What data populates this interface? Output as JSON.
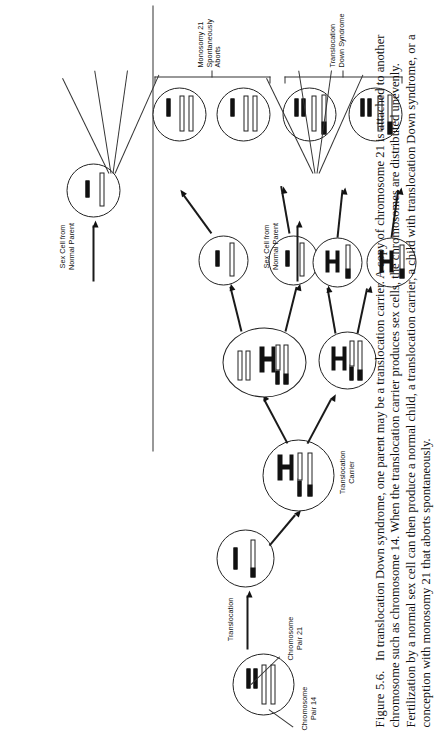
{
  "figure": {
    "number": "Figure 5.6.",
    "caption": "In translocation Down syndrome, one parent may be a translocation carrier. A copy of chromosome 21 is attached to another chromosome such as chromosome 14. When the translocation carrier produces sex cells, the chromosomes are distributed unevenly. Fertilization by a normal sex cell can then produce a normal child, a translocation carrier, a child with translocation Down syndrome, or a conception with monosomy 21 that aborts spontaneously.",
    "title_alt": "Translocation Down syndrome inheritance"
  },
  "labels": {
    "chromosome_pair_14": "Chromosome\nPair 14",
    "chromosome_pair_21": "Chromosome\nPair 21",
    "translocation": "Translocation",
    "translocation_carrier": "Translocation\nCarrier",
    "sex_cell_normal_left": "Sex Cell from\nNormal Parent",
    "sex_cell_normal_right": "Sex Cell from\nNormal Parent",
    "outcome_translocation_carriers": "Translocation\nCarriers",
    "outcome_normal": "Normal",
    "outcome_translocation_down": "Translocation\nDown Syndrome",
    "outcome_monosomy": "Monosomy 21\nSpontaneously Aborts"
  },
  "colors": {
    "ink": "#111111",
    "line": "#333333",
    "paper": "#ffffff"
  },
  "diagram": {
    "cells": [
      {
        "id": "normal-parent-cell",
        "role": "Normal parent cell with chromosome pair 14 and pair 21"
      },
      {
        "id": "translocation-event-cell",
        "role": "Cell undergoing translocation"
      },
      {
        "id": "translocation-carrier-cell",
        "role": "Translocation carrier parent cell"
      },
      {
        "id": "meiosis-upper-cell",
        "role": "Meiotic intermediate cell, upper branch"
      },
      {
        "id": "meiosis-lower-cell",
        "role": "Meiotic intermediate cell, lower branch"
      },
      {
        "id": "gamete-1",
        "role": "Sex cell of translocation carrier"
      },
      {
        "id": "gamete-2",
        "role": "Sex cell of translocation carrier"
      },
      {
        "id": "gamete-3",
        "role": "Sex cell of translocation carrier"
      },
      {
        "id": "gamete-4",
        "role": "Sex cell of translocation carrier"
      },
      {
        "id": "normal-gamete-left",
        "role": "Sex cell from normal parent, left branch"
      },
      {
        "id": "normal-gamete-right",
        "role": "Sex cell from normal parent, right branch"
      },
      {
        "id": "zygote-1",
        "role": "Translocation carrier offspring"
      },
      {
        "id": "zygote-2",
        "role": "Translocation carrier offspring"
      },
      {
        "id": "zygote-3",
        "role": "Normal offspring"
      },
      {
        "id": "zygote-4",
        "role": "Normal offspring"
      },
      {
        "id": "zygote-5",
        "role": "Translocation Down syndrome offspring"
      },
      {
        "id": "zygote-6",
        "role": "Translocation Down syndrome offspring"
      },
      {
        "id": "zygote-7",
        "role": "Monosomy 21 conception"
      },
      {
        "id": "zygote-8",
        "role": "Monosomy 21 conception"
      }
    ]
  }
}
